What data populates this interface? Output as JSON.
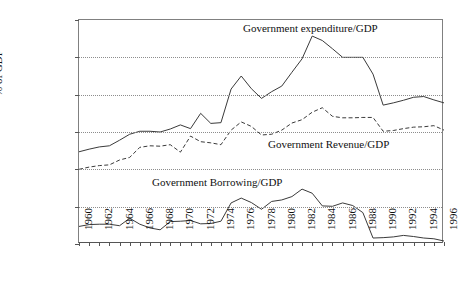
{
  "figure": {
    "cropped_title": "",
    "ylabel": "% of GDP",
    "ytick_labels": [
      "60.00%",
      "50.00%",
      "40.00%",
      "30.00%",
      "20.00%",
      "10.00%",
      "0.00%"
    ],
    "xtick_labels": [
      "1960",
      "1962",
      "1964",
      "1966",
      "1968",
      "1970",
      "1972",
      "1974",
      "1976",
      "1978",
      "1980",
      "1982",
      "1984",
      "1986",
      "1988",
      "1990",
      "1992",
      "1994",
      "1996"
    ],
    "annotations": {
      "expenditure": "Government expenditure/GDP",
      "revenue": "Government Revenue/GDP",
      "borrowing": "Government Borrowing/GDP"
    },
    "colors": {
      "line": "#3a3a3a",
      "grid": "#8d8d8d",
      "axis": "#555555",
      "background": "#ffffff"
    }
  },
  "chart_data": {
    "type": "line",
    "title": "",
    "xlabel": "",
    "ylabel": "% of GDP",
    "xlim": [
      1960,
      1996
    ],
    "ylim": [
      0,
      60
    ],
    "yunit": "percent",
    "ytick_values": [
      0,
      10,
      20,
      30,
      40,
      50,
      60
    ],
    "xtick_values": [
      1960,
      1962,
      1964,
      1966,
      1968,
      1970,
      1972,
      1974,
      1976,
      1978,
      1980,
      1982,
      1984,
      1986,
      1988,
      1990,
      1992,
      1994,
      1996
    ],
    "grid": "horizontal-dotted",
    "legend": "inline-annotations",
    "x": [
      1960,
      1961,
      1962,
      1963,
      1964,
      1965,
      1966,
      1967,
      1968,
      1969,
      1970,
      1971,
      1972,
      1973,
      1974,
      1975,
      1976,
      1977,
      1978,
      1979,
      1980,
      1981,
      1982,
      1983,
      1984,
      1985,
      1986,
      1987,
      1988,
      1989,
      1990,
      1991,
      1992,
      1993,
      1994,
      1995,
      1996
    ],
    "series": [
      {
        "name": "Government expenditure/GDP",
        "style": "solid",
        "values": [
          24.7,
          25.4,
          26.0,
          26.3,
          27.8,
          29.4,
          30.2,
          30.2,
          30.0,
          30.8,
          31.9,
          30.9,
          35.0,
          32.3,
          32.5,
          41.5,
          45.0,
          41.6,
          39.0,
          40.8,
          42.3,
          46.0,
          49.6,
          55.7,
          54.5,
          52.3,
          50.0,
          50.0,
          50.0,
          45.5,
          37.2,
          37.8,
          38.5,
          39.3,
          39.5,
          38.6,
          37.8
        ]
      },
      {
        "name": "Government Revenue/GDP",
        "style": "dashed",
        "values": [
          20.0,
          20.6,
          21.0,
          21.2,
          22.5,
          23.2,
          25.9,
          26.3,
          26.2,
          26.6,
          24.6,
          28.9,
          27.4,
          27.1,
          26.6,
          30.5,
          32.7,
          31.5,
          29.2,
          29.4,
          30.5,
          32.4,
          33.3,
          35.3,
          36.5,
          34.2,
          33.8,
          33.8,
          33.9,
          33.9,
          30.2,
          30.4,
          30.9,
          31.3,
          31.4,
          31.7,
          30.5
        ]
      },
      {
        "name": "Government Borrowing/GDP",
        "style": "solid",
        "values": [
          4.7,
          5.2,
          5.3,
          5.3,
          4.9,
          6.9,
          5.3,
          4.3,
          3.8,
          6.0,
          6.1,
          6.3,
          5.4,
          5.5,
          6.1,
          11.0,
          12.3,
          11.1,
          9.3,
          11.4,
          11.8,
          12.7,
          14.7,
          13.6,
          10.2,
          10.1,
          11.0,
          10.3,
          8.4,
          1.6,
          1.7,
          1.9,
          2.3,
          2.0,
          1.6,
          1.4,
          0.8
        ]
      }
    ]
  }
}
